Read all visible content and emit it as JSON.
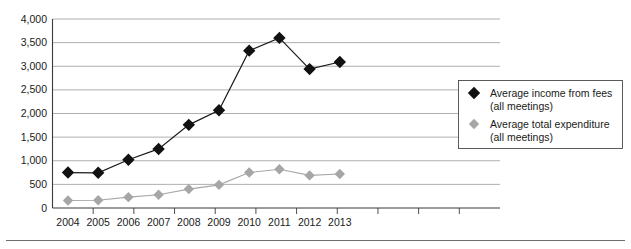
{
  "chart_data": {
    "type": "line",
    "title": "",
    "subtitle": "",
    "xlabel": "",
    "ylabel": "",
    "categories": [
      "2004",
      "2005",
      "2006",
      "2007",
      "2008",
      "2009",
      "2010",
      "2011",
      "2012",
      "2013"
    ],
    "series": [
      {
        "name": "Average income from fees (all meetings)",
        "legend_line1": "Average income from fees",
        "legend_line2": "(all meetings)",
        "marker": "diamond",
        "color": "#111111",
        "values": [
          750,
          745,
          1020,
          1250,
          1760,
          2070,
          3330,
          3600,
          2940,
          3090
        ]
      },
      {
        "name": "Average total expenditure (all meetings)",
        "legend_line1": "Average total expenditure",
        "legend_line2": "(all meetings)",
        "marker": "diamond",
        "color": "#a6a6a6",
        "values": [
          160,
          165,
          230,
          280,
          400,
          490,
          750,
          820,
          690,
          720
        ]
      }
    ],
    "ylim": [
      0,
      4000
    ],
    "ytick_values": [
      0,
      500,
      1000,
      1500,
      2000,
      2500,
      3000,
      3500,
      4000
    ],
    "ytick_labels": [
      "0",
      "500",
      "1,000",
      "1,500",
      "2,000",
      "2,500",
      "3,000",
      "3,500",
      "4,000"
    ],
    "grid": true,
    "legend_position": "right"
  },
  "legend": {
    "items": [
      {
        "line1": "Average income from fees",
        "line2": "(all meetings)",
        "swatch": "diamond-black-icon"
      },
      {
        "line1": "Average total expenditure",
        "line2": "(all meetings)",
        "swatch": "diamond-gray-icon"
      }
    ]
  }
}
